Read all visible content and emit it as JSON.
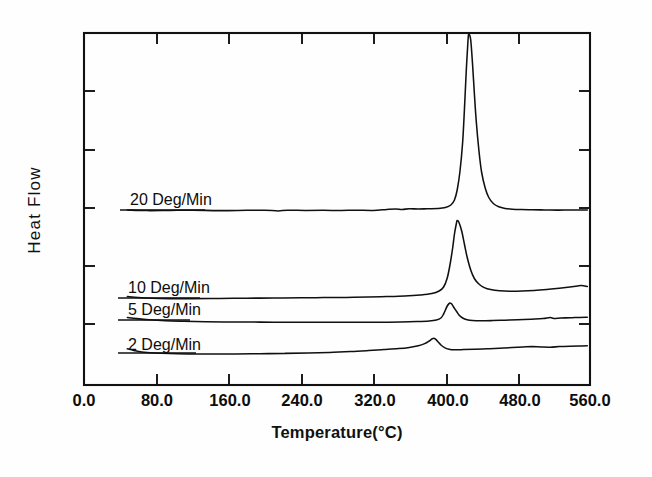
{
  "chart_data": {
    "type": "line",
    "title": "",
    "xlabel": "Temperature(°C)",
    "ylabel": "Heat Flow",
    "xlim": [
      0.0,
      560.0
    ],
    "xticks": [
      0.0,
      80.0,
      160.0,
      240.0,
      320.0,
      400.0,
      480.0,
      560.0
    ],
    "xtick_labels": [
      "0.0",
      "80.0",
      "160.0",
      "240.0",
      "320.0",
      "400.0",
      "480.0",
      "560.0"
    ],
    "ylim": [
      0,
      100
    ],
    "yticks": [
      14,
      30,
      45,
      61,
      77
    ],
    "ytick_labels": [
      "",
      "",
      "",
      "",
      ""
    ],
    "grid": false,
    "legend_position": "inline-annotations",
    "series": [
      {
        "name": "20 Deg/Min",
        "label": "20  Deg/Min",
        "baseline_level": 210,
        "peak_temperature": 425,
        "peak_clipped_at_axis_top": true,
        "x_start": 48,
        "x_end": 557,
        "points": [
          [
            48,
            210
          ],
          [
            70,
            210.6
          ],
          [
            95,
            210.4
          ],
          [
            120,
            210.2
          ],
          [
            150,
            210.6
          ],
          [
            180,
            210.3
          ],
          [
            200,
            210.2
          ],
          [
            215,
            210.9
          ],
          [
            225,
            210.2
          ],
          [
            245,
            210.4
          ],
          [
            265,
            210.3
          ],
          [
            285,
            210.5
          ],
          [
            300,
            210.2
          ],
          [
            320,
            210.4
          ],
          [
            335,
            209.4
          ],
          [
            345,
            208.9
          ],
          [
            352,
            209.4
          ],
          [
            360,
            208.8
          ],
          [
            370,
            209.0
          ],
          [
            380,
            208.8
          ],
          [
            392,
            208.6
          ],
          [
            400,
            207.6
          ],
          [
            406,
            205.0
          ],
          [
            410,
            200.0
          ],
          [
            413,
            190.0
          ],
          [
            416,
            172.0
          ],
          [
            419,
            143.0
          ],
          [
            421,
            110.0
          ],
          [
            423,
            72.0
          ],
          [
            425,
            40.0
          ],
          [
            426,
            33.0
          ],
          [
            428,
            40.0
          ],
          [
            430,
            64.0
          ],
          [
            432,
            93.0
          ],
          [
            434,
            120.0
          ],
          [
            437,
            150.0
          ],
          [
            440,
            172.0
          ],
          [
            444,
            188.0
          ],
          [
            448,
            197.5
          ],
          [
            453,
            203.5
          ],
          [
            459,
            206.8
          ],
          [
            466,
            208.4
          ],
          [
            474,
            209.2
          ],
          [
            484,
            209.6
          ],
          [
            496,
            209.8
          ],
          [
            510,
            209.9
          ],
          [
            524,
            210.1
          ],
          [
            540,
            210.0
          ],
          [
            557,
            210.1
          ]
        ]
      },
      {
        "name": "10 Deg/Min",
        "label": "10  Deg/Min",
        "baseline_level": 298,
        "peak_temperature": 413,
        "peak_height_px": 220,
        "x_start": 48,
        "x_end": 557,
        "points": [
          [
            48,
            296.5
          ],
          [
            60,
            297.6
          ],
          [
            75,
            298.3
          ],
          [
            95,
            298.6
          ],
          [
            120,
            298.6
          ],
          [
            150,
            298.4
          ],
          [
            180,
            298.2
          ],
          [
            210,
            298.0
          ],
          [
            240,
            297.8
          ],
          [
            265,
            297.6
          ],
          [
            290,
            297.4
          ],
          [
            315,
            297.0
          ],
          [
            335,
            296.6
          ],
          [
            355,
            296.0
          ],
          [
            372,
            295.0
          ],
          [
            385,
            293.6
          ],
          [
            393,
            291.0
          ],
          [
            398,
            287.0
          ],
          [
            402,
            278.0
          ],
          [
            405,
            265.0
          ],
          [
            408,
            248.0
          ],
          [
            410,
            234.0
          ],
          [
            412,
            224.0
          ],
          [
            413,
            220.5
          ],
          [
            415,
            222.5
          ],
          [
            418,
            231.0
          ],
          [
            421,
            244.0
          ],
          [
            424,
            257.0
          ],
          [
            428,
            270.0
          ],
          [
            432,
            278.5
          ],
          [
            437,
            284.0
          ],
          [
            443,
            287.6
          ],
          [
            450,
            289.6
          ],
          [
            460,
            290.8
          ],
          [
            472,
            291.2
          ],
          [
            485,
            291.0
          ],
          [
            498,
            290.4
          ],
          [
            512,
            289.4
          ],
          [
            526,
            288.2
          ],
          [
            540,
            286.8
          ],
          [
            550,
            285.6
          ],
          [
            557,
            286.4
          ]
        ]
      },
      {
        "name": "5 Deg/Min",
        "label": "5  Deg/Min",
        "baseline_level": 320,
        "peak_temperature": 405,
        "peak_height_px": 303,
        "x_start": 48,
        "x_end": 557,
        "points": [
          [
            48,
            317.5
          ],
          [
            58,
            318.6
          ],
          [
            72,
            319.8
          ],
          [
            90,
            320.8
          ],
          [
            110,
            321.3
          ],
          [
            135,
            321.7
          ],
          [
            165,
            322.0
          ],
          [
            195,
            322.1
          ],
          [
            225,
            322.2
          ],
          [
            255,
            322.3
          ],
          [
            285,
            322.3
          ],
          [
            310,
            322.2
          ],
          [
            330,
            322.2
          ],
          [
            350,
            322.0
          ],
          [
            368,
            321.6
          ],
          [
            382,
            321.0
          ],
          [
            390,
            320.0
          ],
          [
            395,
            318.0
          ],
          [
            398,
            314.0
          ],
          [
            400,
            310.0
          ],
          [
            402,
            306.0
          ],
          [
            404,
            303.6
          ],
          [
            405,
            303.0
          ],
          [
            407,
            304.0
          ],
          [
            409,
            307.0
          ],
          [
            412,
            311.0
          ],
          [
            415,
            315.0
          ],
          [
            419,
            318.0
          ],
          [
            424,
            319.8
          ],
          [
            430,
            320.6
          ],
          [
            440,
            320.8
          ],
          [
            452,
            320.6
          ],
          [
            466,
            320.2
          ],
          [
            480,
            319.8
          ],
          [
            495,
            319.2
          ],
          [
            508,
            318.6
          ],
          [
            516,
            317.6
          ],
          [
            520,
            318.4
          ],
          [
            528,
            318.0
          ],
          [
            538,
            317.8
          ],
          [
            548,
            317.4
          ],
          [
            557,
            317.2
          ]
        ]
      },
      {
        "name": "2 Deg/Min",
        "label": "2  Deg/Min",
        "baseline_level": 352,
        "peak_temperature": 387,
        "peak_height_px": 338,
        "x_start": 48,
        "x_end": 557,
        "points": [
          [
            48,
            348.8
          ],
          [
            55,
            350.4
          ],
          [
            64,
            352.0
          ],
          [
            78,
            353.0
          ],
          [
            95,
            353.6
          ],
          [
            115,
            353.9
          ],
          [
            140,
            354.0
          ],
          [
            168,
            353.9
          ],
          [
            195,
            353.7
          ],
          [
            222,
            353.4
          ],
          [
            248,
            353.0
          ],
          [
            272,
            352.4
          ],
          [
            295,
            351.6
          ],
          [
            315,
            350.6
          ],
          [
            332,
            349.6
          ],
          [
            348,
            348.6
          ],
          [
            360,
            347.4
          ],
          [
            370,
            345.8
          ],
          [
            377,
            343.6
          ],
          [
            382,
            341.0
          ],
          [
            385,
            339.0
          ],
          [
            387,
            338.2
          ],
          [
            389,
            339.2
          ],
          [
            392,
            342.0
          ],
          [
            395,
            345.0
          ],
          [
            399,
            347.6
          ],
          [
            404,
            349.2
          ],
          [
            410,
            349.8
          ],
          [
            420,
            349.6
          ],
          [
            432,
            349.2
          ],
          [
            446,
            348.8
          ],
          [
            460,
            348.2
          ],
          [
            474,
            347.6
          ],
          [
            486,
            347.0
          ],
          [
            496,
            346.6
          ],
          [
            506,
            347.0
          ],
          [
            516,
            347.2
          ],
          [
            526,
            346.6
          ],
          [
            538,
            346.2
          ],
          [
            548,
            346.0
          ],
          [
            557,
            345.8
          ]
        ]
      }
    ],
    "annotations": [
      {
        "text": "20  Deg/Min",
        "x_px": 130,
        "y_px": 205
      },
      {
        "text": "10  Deg/Min",
        "x_px": 128,
        "y_px": 293
      },
      {
        "text": "5  Deg/Min",
        "x_px": 128,
        "y_px": 315
      },
      {
        "text": "2  Deg/Min",
        "x_px": 128,
        "y_px": 350
      }
    ]
  },
  "axes": {
    "x_axis_title": "Temperature(°C)",
    "y_axis_title": "Heat Flow",
    "x_tick_labels": [
      "0.0",
      "80.0",
      "160.0",
      "240.0",
      "320.0",
      "400.0",
      "480.0",
      "560.0"
    ]
  },
  "colors": {
    "background": "#ffffff",
    "ink": "#111111",
    "curve": "#101010"
  }
}
